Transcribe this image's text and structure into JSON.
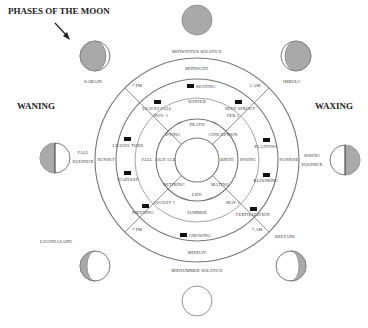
{
  "title": "PHASES OF THE MOON",
  "side_labels": {
    "waning": "WANING",
    "waxing": "WAXING"
  },
  "colors": {
    "moon_shadow": "#a9a9a9",
    "ring_stroke": "#777777",
    "marker": "#111111",
    "background": "#ffffff"
  },
  "outer_labels": {
    "top": "MIDWINTER SOLSTICE",
    "bottom": "MIDSUMMER SOLSTICE",
    "top_left": "SAMAIN",
    "top_right": "IMBOLC",
    "bottom_left": "LUGHNASADH",
    "bottom_right": "BELTANE",
    "left_line1": "FALL",
    "left_line2": "EQUINOX",
    "right_line1": "SPRING",
    "right_line2": "EQUINOX"
  },
  "ring_day": {
    "top": "MIDNIGHT",
    "bottom": "MIDDAY",
    "left": "SUNSET",
    "right": "SUNRISE",
    "tl": "7 PM",
    "tr": "2 AM",
    "bl": "7 PM",
    "br": "7 AM"
  },
  "ring_activity": {
    "top": "RESTING",
    "tl": "LEAVES FALL",
    "tr": "SEED SPROUT",
    "left_upper": "LEAVES TURN",
    "left_lower": "HARVEST",
    "right_upper": "PLANTING",
    "right_lower": "BLOOMING",
    "bl": "RIPENING",
    "br": "FERTILIZATION",
    "bottom": "GROWING"
  },
  "ring_season": {
    "top": "WINTER",
    "bottom": "SUMMER",
    "left": "FALL",
    "right": "SPRING",
    "tl": "NOV. 1",
    "tr": "FEB 1",
    "bl": "AUGUST 1",
    "br": "MAY 1"
  },
  "ring_life": {
    "top": "DEATH",
    "bottom": "LIFE",
    "left": "OLD AGE",
    "right": "BIRTH",
    "tl": "DYING",
    "tr": "CONCEPTION",
    "bl": "RETIRING",
    "br": "MATING"
  },
  "moons": [
    {
      "name": "new-moon",
      "position": "top"
    },
    {
      "name": "waxing-crescent-moon",
      "position": "top-right"
    },
    {
      "name": "first-quarter-moon",
      "position": "right"
    },
    {
      "name": "waxing-gibbous-moon",
      "position": "bottom-right"
    },
    {
      "name": "full-moon",
      "position": "bottom"
    },
    {
      "name": "waning-gibbous-moon",
      "position": "bottom-left"
    },
    {
      "name": "last-quarter-moon",
      "position": "left"
    },
    {
      "name": "waning-crescent-moon",
      "position": "top-left"
    }
  ]
}
